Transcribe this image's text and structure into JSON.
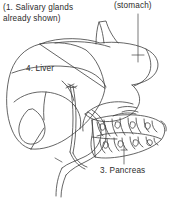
{
  "figure": {
    "background_color": "#ffffff",
    "ink_color": "#3a3a3a",
    "width": 170,
    "height": 199
  },
  "labels": {
    "salivary_line1": "(1. Salivary glands",
    "salivary_line2": "already shown)",
    "stomach": "(stomach)",
    "liver": "4.  Liver",
    "pancreas": "3.  Pancreas"
  },
  "structures": [
    {
      "name": "liver",
      "number": "4",
      "label": "Liver"
    },
    {
      "name": "pancreas",
      "number": "3",
      "label": "Pancreas"
    },
    {
      "name": "stomach",
      "number": "",
      "label": "(stomach)"
    },
    {
      "name": "salivary-glands",
      "number": "1",
      "label": "Salivary glands"
    }
  ]
}
